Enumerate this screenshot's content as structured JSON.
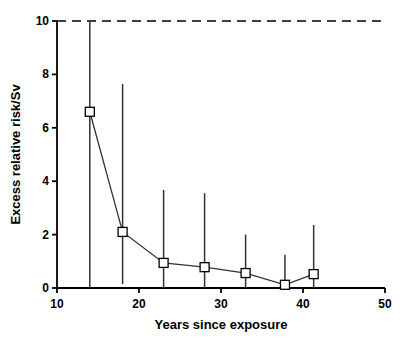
{
  "chart_data": {
    "type": "scatter",
    "title": "",
    "subtitle": "",
    "xlabel": "Years since exposure",
    "ylabel": "Excess relative risk/Sv",
    "xlim": [
      10,
      50
    ],
    "ylim": [
      0,
      10
    ],
    "xticks": [
      10,
      20,
      30,
      40,
      50
    ],
    "yticks": [
      0,
      2,
      4,
      6,
      8,
      10
    ],
    "xtick_labels": [
      "10",
      "20",
      "30",
      "40",
      "50"
    ],
    "ytick_labels": [
      "0",
      "2",
      "4",
      "6",
      "8",
      "10"
    ],
    "grid": false,
    "legend": null,
    "legend_position": "none",
    "marker": "open-square",
    "line_style": "solid",
    "series": [
      {
        "name": "Excess relative risk per Sv",
        "x": [
          14,
          18,
          23,
          28,
          33,
          37.8,
          41.3
        ],
        "values": [
          6.6,
          2.1,
          0.94,
          0.78,
          0.56,
          0.12,
          0.52
        ],
        "error_upper": [
          10.0,
          7.64,
          3.67,
          3.55,
          2.0,
          1.25,
          2.36
        ],
        "error_lower": [
          0.0,
          0.15,
          0.0,
          0.0,
          0.0,
          0.0,
          0.0
        ]
      }
    ],
    "annotations": [
      {
        "name": "upper-limit-dashed-line",
        "type": "horizontal-dashed-line",
        "y": 10,
        "label": ""
      }
    ],
    "colors": {
      "axis": "#000000",
      "line": "#333333",
      "marker_fill": "#ffffff",
      "marker_stroke": "#000000",
      "error_bar": "#333333",
      "dashed_line": "#000000",
      "background": "#ffffff"
    }
  }
}
